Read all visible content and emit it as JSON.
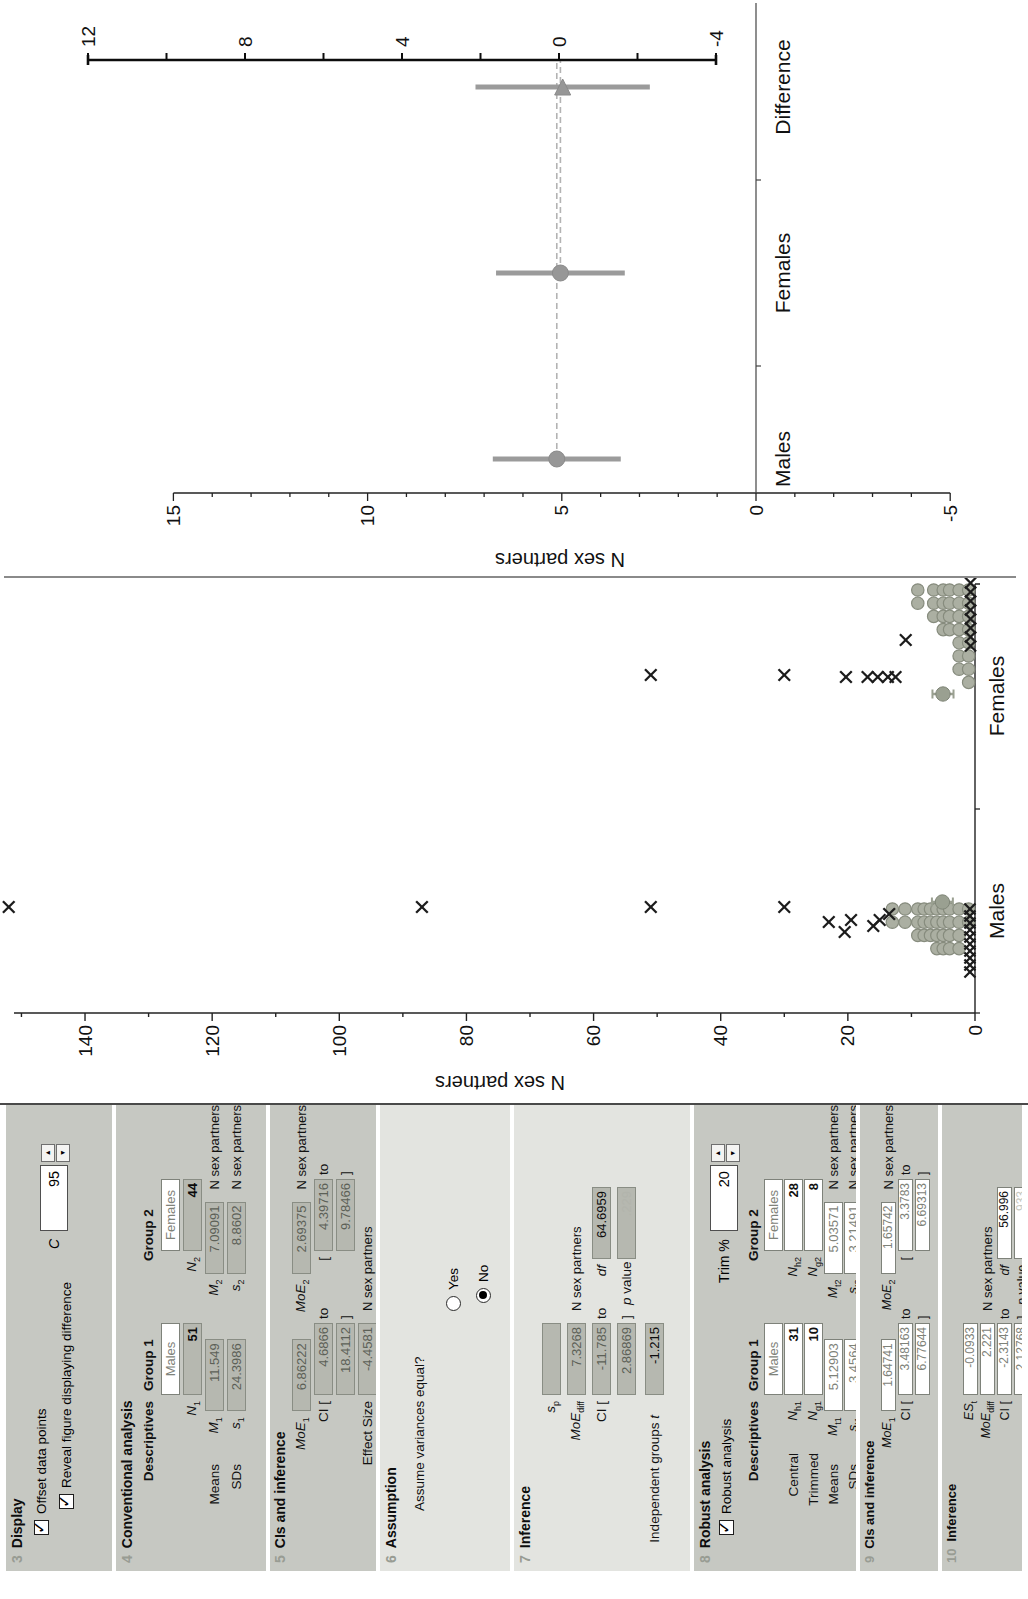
{
  "panels": {
    "p3": {
      "num": "3",
      "title": "Display",
      "cb1": "Offset data points",
      "cb1_checked": true,
      "cb2": "Reveal figure displaying difference",
      "cb2_checked": true,
      "c_label": "C",
      "c_value": "95"
    },
    "p4": {
      "num": "4",
      "title": "Conventional analysis",
      "desc": "Descriptives",
      "g1": "Group 1",
      "g2": "Group 2",
      "males": "Males",
      "females": "Females",
      "n": {
        "v": "N",
        "s1": "1",
        "val1": "51",
        "s2": "2",
        "val2": "44"
      },
      "means": {
        "label": "Means",
        "v": "M",
        "s1": "1",
        "val1": "11.549",
        "s2": "2",
        "val2": "7.09091",
        "units": "N sex partners"
      },
      "sds": {
        "label": "SDs",
        "v": "s",
        "s1": "1",
        "val1": "24.3986",
        "s2": "2",
        "val2": "8.8602",
        "units": "N sex partners"
      }
    },
    "p5": {
      "num": "5",
      "title": "CIs and inference",
      "moe": {
        "v": "MoE",
        "s1": "1",
        "val1": "6.86222",
        "s2": "2",
        "val2": "2.69375",
        "units": "N sex partners"
      },
      "ci_a": {
        "open1": "CI [",
        "val1": "4.6866",
        "to1": "to",
        "open2": "[",
        "val2": "4.39716",
        "to2": "to"
      },
      "ci_b": {
        "val1": "18.4112",
        "close1": "]",
        "val2": "9.78466",
        "close2": "]"
      },
      "es": {
        "label": "Effect Size",
        "val": "-4.4581",
        "units": "N sex partners"
      }
    },
    "p6": {
      "num": "6",
      "title": "Assumption",
      "question": "Assume variances equal?",
      "yes": "Yes",
      "yes_selected": false,
      "no": "No",
      "no_selected": true
    },
    "p7": {
      "num": "7",
      "title": "Inference",
      "sp": {
        "v": "s",
        "s": "p",
        "val": ""
      },
      "moediff": {
        "v": "MoE",
        "s": "diff",
        "val": "7.3268",
        "units": "N sex partners"
      },
      "ci_a": {
        "open": "CI [",
        "val": "-11.785",
        "to": "to",
        "df_label": "df",
        "df_val": "64.6959"
      },
      "ci_b": {
        "val": "2.86869",
        "close": "]",
        "p_var": "p",
        "p_rest": "value",
        "p_val": ".229"
      },
      "t": {
        "label": "Independent groups",
        "tvar": "t",
        "val": "-1.215"
      }
    },
    "p8": {
      "num": "8",
      "title": "Robust analysis",
      "cb": "Robust analysis",
      "cb_checked": true,
      "trim_label": "Trim %",
      "trim_value": "20",
      "desc": "Descriptives",
      "g1": "Group 1",
      "g2": "Group 2",
      "males": "Males",
      "females": "Females",
      "central": {
        "label": "Central",
        "v": "N",
        "s1": "h1",
        "val1": "31",
        "s2": "h2",
        "val2": "28"
      },
      "trimmed": {
        "label": "Trimmed",
        "v": "N",
        "s1": "g1",
        "val1": "10",
        "s2": "g2",
        "val2": "8"
      },
      "means": {
        "label": "Means",
        "v": "M",
        "s1": "t1",
        "val1": "5.12903",
        "s2": "t2",
        "val2": "5.03571",
        "units": "N sex partners"
      },
      "sds": {
        "label": "SDs",
        "v": "s",
        "s1": "t1",
        "val1": "3.4564",
        "s2": "t2",
        "val2": "3.21491",
        "units": "N sex partners"
      }
    },
    "p9": {
      "num": "9",
      "title": "CIs and inference",
      "moe": {
        "v": "MoE",
        "s1": "1",
        "val1": "1.64741",
        "s2": "2",
        "val2": "1.65742",
        "units": "N sex partners"
      },
      "ci_a": {
        "open1": "CI [",
        "val1": "3.48163",
        "to1": "to",
        "open2": "[",
        "val2": "3.3783",
        "to2": "to"
      },
      "ci_b": {
        "val1": "6.77644",
        "close1": "]",
        "val2": "6.69313",
        "close2": "]"
      }
    },
    "p10": {
      "num": "10",
      "title": "Inference",
      "es": {
        "v": "ES",
        "s": "t",
        "val": "-0.0933"
      },
      "moediff": {
        "v": "MoE",
        "s": "diff",
        "val": "2.221",
        "units": "N sex partners"
      },
      "ci_a": {
        "open": "CI [",
        "val": "-2.3143",
        "to": "to",
        "df_label": "df",
        "df_val": "56.996"
      },
      "ci_b": {
        "val": "2.12768",
        "close": "]",
        "p_var": "p",
        "p_rest": "value",
        "p_val": ".933"
      }
    }
  },
  "icons": {
    "spin_up": "▲",
    "spin_down": "▼"
  },
  "chart_data": [
    {
      "type": "scatter",
      "title": "Dot plot of individual data values by group",
      "ylabel": "N sex partners",
      "ylim": [
        0,
        150
      ],
      "ytick_major": 20,
      "ytick_minor": 10,
      "ytick_labels": [
        0,
        20,
        40,
        60,
        80,
        100,
        120,
        140
      ],
      "categories": [
        "Males",
        "Females"
      ],
      "grid": false,
      "layout": {
        "axis_x": 85,
        "baseline_y": 975,
        "px_per_unit": 6.357,
        "axis_top_y": 14,
        "baseline_x_end": 514,
        "cat_tick_x": [
          85,
          289,
          514
        ],
        "cat_center_x": [
          187,
          402
        ],
        "ylabel_x": 22,
        "ylabel_y": 500,
        "dot_radius": 6.2,
        "dot_step": 13.2
      },
      "dot_color": "#abafa2",
      "dot_stroke": "#878c7e",
      "x_color": "#1c1c1c",
      "marker_color": "#9aa091",
      "groups": [
        {
          "name": "Males",
          "base_x": 189,
          "dot_rows": [
            {
              "value": 13,
              "count": 2
            },
            {
              "value": 11,
              "count": 2
            },
            {
              "value": 9,
              "count": 3
            },
            {
              "value": 8,
              "count": 3
            },
            {
              "value": 7,
              "count": 3
            },
            {
              "value": 6,
              "count": 4
            },
            {
              "value": 5,
              "count": 4
            },
            {
              "value": 4,
              "count": 4
            },
            {
              "value": 2.5,
              "count": 4
            },
            {
              "value": 1,
              "count": 2
            }
          ],
          "x_high": [
            {
              "x": 191,
              "value": 152
            },
            {
              "x": 191,
              "value": 87
            },
            {
              "x": 191,
              "value": 51
            },
            {
              "x": 191,
              "value": 30
            },
            {
              "x": 176,
              "value": 23
            },
            {
              "x": 166,
              "value": 20.5
            },
            {
              "x": 178,
              "value": 19.5
            },
            {
              "x": 172,
              "value": 16
            },
            {
              "x": 178,
              "value": 15
            },
            {
              "x": 184,
              "value": 13.5
            }
          ],
          "x_low": {
            "value": 0.8,
            "count": 10,
            "x_start": 189,
            "step": -7
          },
          "mean_marker": {
            "x": 196,
            "mean": 5.12903,
            "ci": [
              3.48163,
              6.77644
            ]
          }
        },
        {
          "name": "Females",
          "base_x": 508,
          "dot_rows": [
            {
              "value": 9,
              "count": 2
            },
            {
              "value": 6.5,
              "count": 3
            },
            {
              "value": 5,
              "count": 4
            },
            {
              "value": 4,
              "count": 4
            },
            {
              "value": 2.5,
              "count": 7
            },
            {
              "value": 1,
              "count": 8
            }
          ],
          "x_high": [
            {
              "x": 423,
              "value": 51
            },
            {
              "x": 423,
              "value": 30
            },
            {
              "x": 421,
              "value": 20.3
            },
            {
              "x": 421,
              "value": 16.9
            },
            {
              "x": 421,
              "value": 15.3
            },
            {
              "x": 421,
              "value": 13.7
            },
            {
              "x": 421,
              "value": 12.5
            },
            {
              "x": 458,
              "value": 10.9
            }
          ],
          "x_low": {
            "value": 0.7,
            "count": 8,
            "x_start": 515,
            "step": -9
          },
          "mean_marker": {
            "x": 404,
            "mean": 5.03571,
            "ci": [
              3.3783,
              6.69313
            ]
          }
        }
      ]
    },
    {
      "type": "ci-means",
      "title": "Group means and difference with 95% CIs",
      "ylabel": "N sex partners",
      "ylim": [
        -5,
        15
      ],
      "ytick_major": 5,
      "ytick_minor": 1,
      "ytick_labels": [
        -5,
        0,
        5,
        10,
        15
      ],
      "categories": [
        "Males",
        "Females",
        "Difference"
      ],
      "layout": {
        "axis_x": 84,
        "zero_y": 756,
        "px_per_unit": 38.84,
        "zero_line_x2": 574,
        "cat_center_x": [
          118,
          304,
          490
        ],
        "cat_tick_x": [
          211,
          397
        ],
        "label_y": 790,
        "ylabel_x": 24,
        "ylabel_y": 560,
        "diff_axis": {
          "x": 517,
          "top_value": 12,
          "bottom_value": -4,
          "zero_y": 559,
          "px_per_unit": 39.25,
          "tick_step": 2,
          "labels": [
            12,
            8,
            4,
            0,
            -4
          ]
        }
      },
      "bar_color": "#9b9b9b",
      "marker_color": "#979797",
      "dash_color": "#b3b3b3",
      "series": [
        {
          "name": "Males",
          "mean": 5.12903,
          "ci": [
            3.48163,
            6.77644
          ],
          "marker": "circle",
          "scale": "left"
        },
        {
          "name": "Females",
          "mean": 5.03571,
          "ci": [
            3.3783,
            6.69313
          ],
          "marker": "circle",
          "scale": "left"
        },
        {
          "name": "Difference",
          "mean": -0.0933,
          "ci": [
            -2.3143,
            2.12768
          ],
          "marker": "triangle",
          "scale": "diff"
        }
      ],
      "dashed_lines": [
        {
          "value": 5.12903,
          "from_series": 0
        },
        {
          "value": 5.03571,
          "from_series": 1
        }
      ]
    }
  ]
}
